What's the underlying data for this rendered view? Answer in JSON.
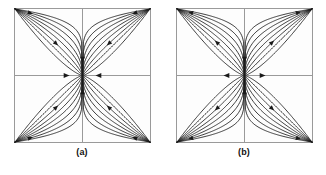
{
  "figure": {
    "title": "",
    "panels": [
      {
        "caption": "(a)",
        "name": "phase-portrait-stable-node",
        "flow_direction": "inward",
        "axis_arrows": {
          "top": "down",
          "bottom": "up",
          "left": "right",
          "right": "left"
        }
      },
      {
        "caption": "(b)",
        "name": "phase-portrait-unstable-node",
        "flow_direction": "outward",
        "axis_arrows": {
          "top": "down",
          "bottom": "up",
          "left": "left",
          "right": "right"
        }
      }
    ]
  },
  "chart_data": {
    "type": "line",
    "title": "",
    "subtitle": "",
    "xlabel": "",
    "ylabel": "",
    "xlim": [
      -1,
      1
    ],
    "ylim": [
      -1,
      1
    ],
    "grid": false,
    "legend": null,
    "axis_ticks": [],
    "curve_count_per_quadrant": 8,
    "trajectory_shape": "power-law curves y = k * sign(x) * |x|^p through origin",
    "curve_exponents": [
      0.16,
      0.24,
      0.34,
      0.46,
      0.6,
      0.78,
      1.0,
      1.35
    ],
    "panels": [
      {
        "label": "(a)",
        "type": "stable node (sink)",
        "flow": "inward",
        "axis_arrow_directions": [
          "down",
          "up",
          "right",
          "left"
        ],
        "quadrant_arrow_flow": "toward origin"
      },
      {
        "label": "(b)",
        "type": "unstable node (source)",
        "flow": "outward",
        "axis_arrow_directions": [
          "down",
          "up",
          "left",
          "right"
        ],
        "quadrant_arrow_flow": "away from origin"
      }
    ],
    "colors": {
      "curve": "#1a1a1a",
      "axis": "#9a9a9a",
      "frame": "#9a9a9a",
      "background": "#fdfdfd",
      "caption": "#111111"
    }
  }
}
